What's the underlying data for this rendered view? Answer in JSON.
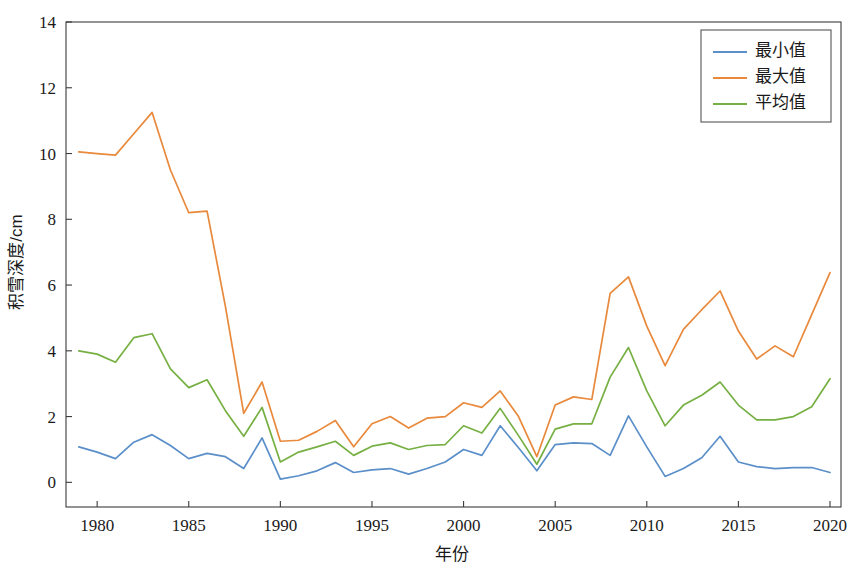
{
  "chart_data": {
    "type": "line",
    "title": "",
    "xlabel": "年份",
    "ylabel": "积雪深度/cm",
    "xlim": [
      1978.3,
      2020.6
    ],
    "ylim": [
      -0.75,
      14
    ],
    "grid": false,
    "legend_position": "top-right",
    "x_ticks": [
      1980,
      1985,
      1990,
      1995,
      2000,
      2005,
      2010,
      2015,
      2020
    ],
    "y_ticks": [
      0,
      2,
      4,
      6,
      8,
      10,
      12,
      14
    ],
    "x": [
      1979,
      1980,
      1981,
      1982,
      1983,
      1984,
      1985,
      1986,
      1987,
      1988,
      1989,
      1990,
      1991,
      1992,
      1993,
      1994,
      1995,
      1996,
      1997,
      1998,
      1999,
      2000,
      2001,
      2002,
      2003,
      2004,
      2005,
      2006,
      2007,
      2008,
      2009,
      2010,
      2011,
      2012,
      2013,
      2014,
      2015,
      2016,
      2017,
      2018,
      2019,
      2020
    ],
    "series": [
      {
        "name": "最小值",
        "color": "#5b8fc9",
        "values": [
          1.08,
          0.92,
          0.72,
          1.22,
          1.45,
          1.12,
          0.72,
          0.88,
          0.78,
          0.42,
          1.35,
          0.1,
          0.2,
          0.35,
          0.6,
          0.3,
          0.38,
          0.42,
          0.25,
          0.42,
          0.62,
          1.0,
          0.82,
          1.72,
          1.05,
          0.35,
          1.15,
          1.2,
          1.18,
          0.82,
          2.02,
          1.08,
          0.18,
          0.42,
          0.75,
          1.4,
          0.62,
          0.48,
          0.42,
          0.45,
          0.45,
          0.3
        ]
      },
      {
        "name": "最大值",
        "color": "#e8893c",
        "values": [
          10.05,
          10.0,
          9.95,
          10.6,
          11.25,
          9.5,
          8.2,
          8.25,
          5.35,
          2.1,
          3.05,
          1.25,
          1.28,
          1.55,
          1.88,
          1.08,
          1.78,
          2.0,
          1.65,
          1.95,
          2.0,
          2.42,
          2.28,
          2.78,
          2.0,
          0.78,
          2.35,
          2.6,
          2.52,
          5.75,
          6.25,
          4.75,
          3.55,
          4.65,
          5.25,
          5.82,
          4.6,
          3.75,
          4.15,
          3.82,
          5.1,
          6.38
        ]
      },
      {
        "name": "平均值",
        "color": "#76b043",
        "values": [
          4.0,
          3.9,
          3.65,
          4.4,
          4.52,
          3.45,
          2.88,
          3.12,
          2.18,
          1.4,
          2.28,
          0.62,
          0.92,
          1.08,
          1.25,
          0.82,
          1.1,
          1.2,
          1.0,
          1.12,
          1.15,
          1.72,
          1.5,
          2.25,
          1.42,
          0.55,
          1.62,
          1.78,
          1.78,
          3.2,
          4.1,
          2.78,
          1.72,
          2.35,
          2.65,
          3.05,
          2.35,
          1.9,
          1.9,
          2.0,
          2.3,
          3.15
        ]
      }
    ]
  },
  "legend": {
    "entries": [
      {
        "label": "最小值"
      },
      {
        "label": "最大值"
      },
      {
        "label": "平均值"
      }
    ]
  },
  "axes": {
    "y_title": "积雪深度/cm",
    "x_title": "年份",
    "y_tick_labels": [
      "0",
      "2",
      "4",
      "6",
      "8",
      "10",
      "12",
      "14"
    ],
    "x_tick_labels": [
      "1980",
      "1985",
      "1990",
      "1995",
      "2000",
      "2005",
      "2010",
      "2015",
      "2020"
    ]
  }
}
